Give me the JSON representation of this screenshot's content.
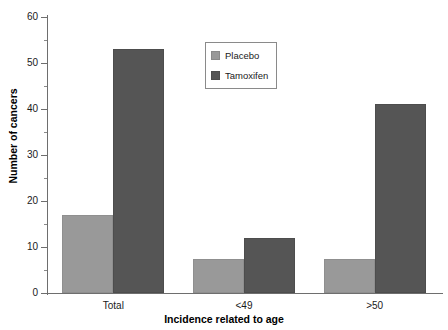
{
  "chart_data": {
    "type": "bar",
    "title": "",
    "xlabel": "Incidence related to age",
    "ylabel": "Number of cancers",
    "categories": [
      "Total",
      "<49",
      ">50"
    ],
    "series": [
      {
        "name": "Placebo",
        "color": "#999999",
        "values": [
          17,
          7.5,
          7.5
        ]
      },
      {
        "name": "Tamoxifen",
        "color": "#555555",
        "values": [
          53,
          12,
          41
        ]
      }
    ],
    "ylim": [
      0,
      60
    ],
    "ytick_labels": [
      "0",
      "10",
      "20",
      "30",
      "40",
      "50",
      "60"
    ],
    "ytick_values": [
      0,
      10,
      20,
      30,
      40,
      50,
      60
    ],
    "yminor_values": [
      5,
      15,
      25,
      35,
      45,
      55
    ],
    "grid": false,
    "legend_position": "upper-center"
  },
  "legend": {
    "items": [
      {
        "label": "Placebo",
        "swatch": "placebo"
      },
      {
        "label": "Tamoxifen",
        "swatch": "tamoxifen"
      }
    ]
  }
}
